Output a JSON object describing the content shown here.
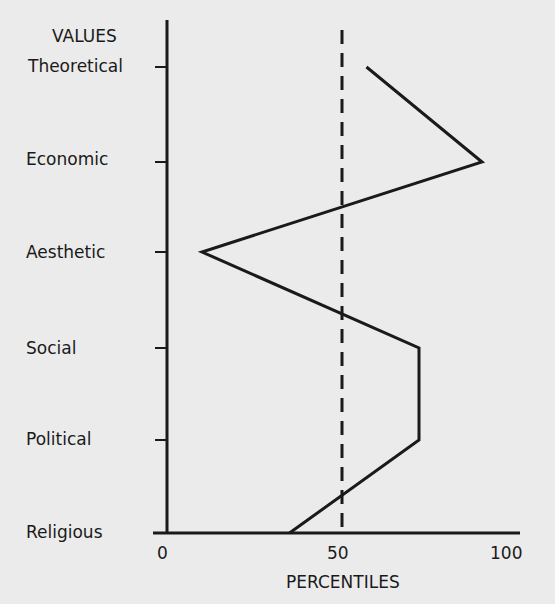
{
  "chart_data": {
    "type": "line",
    "title": "",
    "ylabel": "VALUES",
    "xlabel": "PERCENTILES",
    "categories": [
      "Theoretical",
      "Economic",
      "Aesthetic",
      "Social",
      "Political",
      "Religious"
    ],
    "values": [
      57,
      90,
      10,
      72,
      72,
      35
    ],
    "xlim": [
      0,
      100
    ],
    "xticks": [
      "0",
      "50",
      "100"
    ],
    "reference_line": {
      "x": 50,
      "style": "dashed"
    },
    "grid": false,
    "orientation": "horizontal-profile"
  }
}
